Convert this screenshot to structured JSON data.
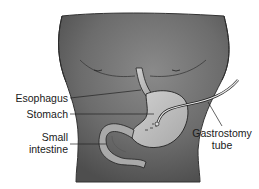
{
  "figure": {
    "type": "anatomical illustration",
    "labels": {
      "esophagus": "Esophagus",
      "stomach": "Stomach",
      "small_intestine_line1": "Small",
      "small_intestine_line2": "intestine",
      "gastrostomy_line1": "Gastrostomy",
      "gastrostomy_line2": "tube"
    },
    "colors": {
      "torso": "#6e6e6e",
      "torso_shadow": "#4a4a4a",
      "organ_fill": "#bdbdbd",
      "outline": "#222222",
      "background": "#ffffff"
    }
  }
}
